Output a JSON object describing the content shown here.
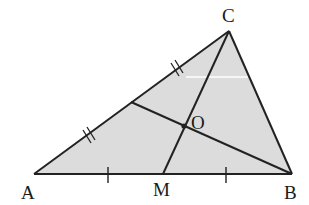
{
  "figure": {
    "type": "triangle-medians",
    "colors": {
      "fill": "#dcdcdc",
      "stroke": "#222222",
      "background": "#ffffff"
    },
    "points": {
      "A": {
        "label": "A",
        "x": 34,
        "y": 174
      },
      "B": {
        "label": "B",
        "x": 292,
        "y": 174
      },
      "C": {
        "label": "C",
        "x": 229,
        "y": 31
      },
      "M": {
        "label": "M",
        "x": 163,
        "y": 174
      },
      "N": {
        "label": "",
        "x": 131,
        "y": 102
      },
      "O": {
        "label": "O",
        "x": 184,
        "y": 126
      }
    },
    "labels": {
      "A": "A",
      "B": "B",
      "C": "C",
      "M": "M",
      "O": "O"
    },
    "segments": [
      {
        "from": "A",
        "to": "B",
        "name": "side-ab"
      },
      {
        "from": "B",
        "to": "C",
        "name": "side-bc"
      },
      {
        "from": "C",
        "to": "A",
        "name": "side-ca"
      },
      {
        "from": "C",
        "to": "M",
        "name": "median-cm"
      },
      {
        "from": "B",
        "to": "N",
        "name": "median-bn"
      }
    ],
    "tick_marks": {
      "AB_single": [
        {
          "x": 108,
          "y": 174
        },
        {
          "x": 226,
          "y": 174
        }
      ],
      "AC_double": [
        {
          "x": 89,
          "y": 135
        },
        {
          "x": 177,
          "y": 68
        }
      ]
    }
  }
}
